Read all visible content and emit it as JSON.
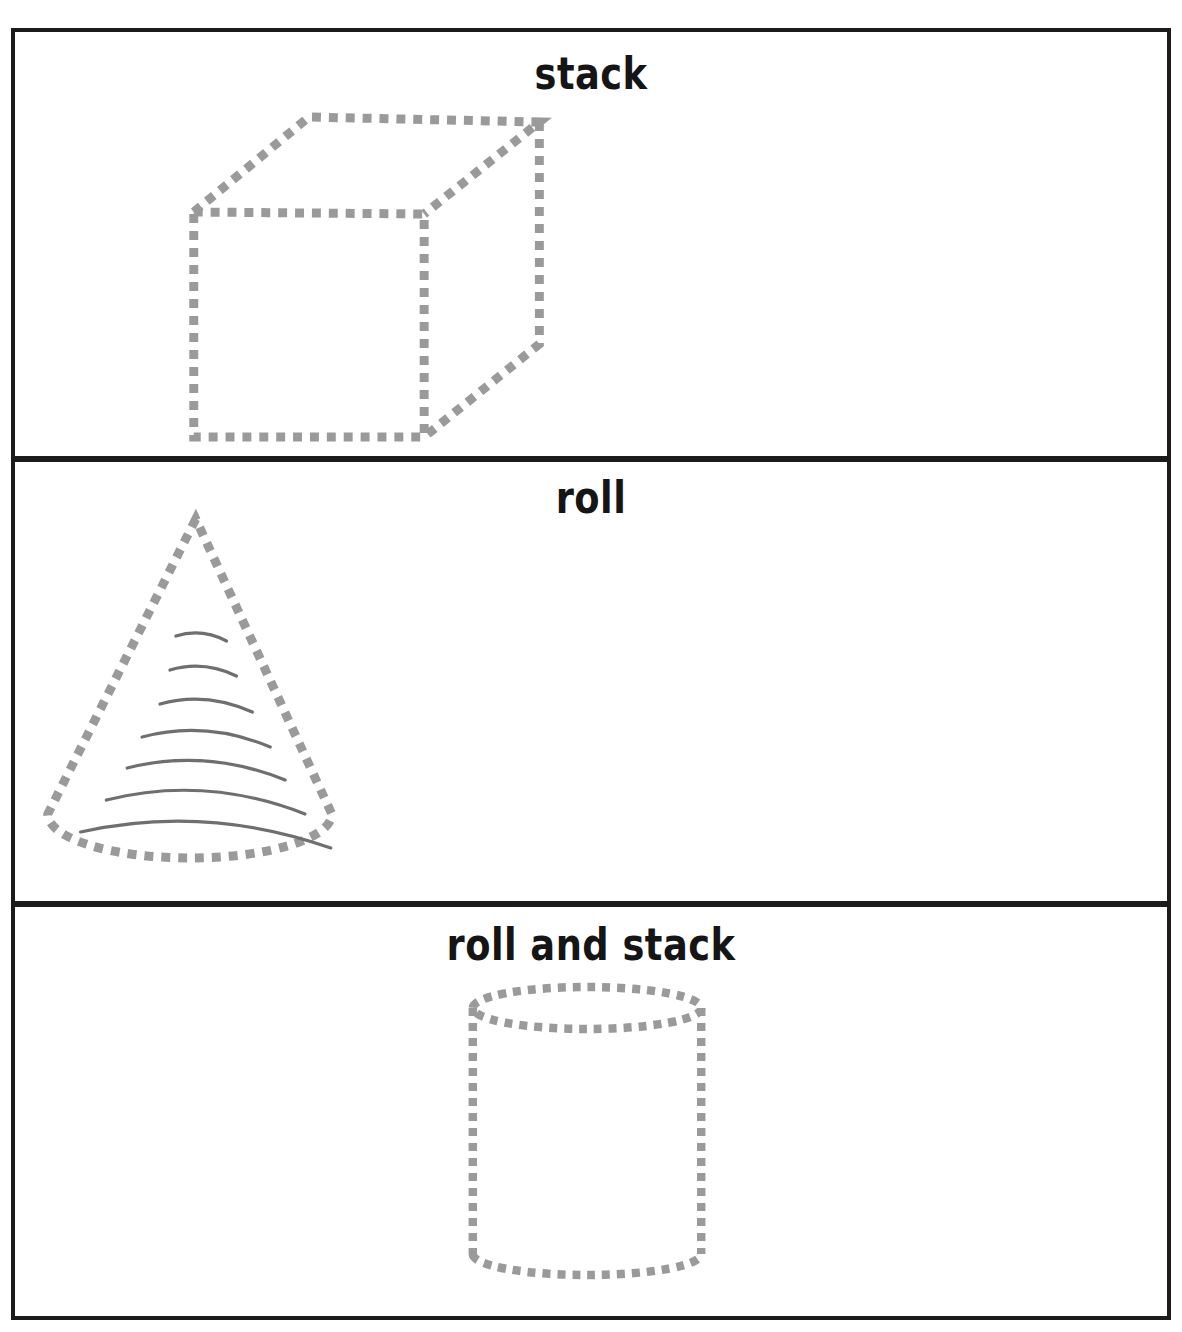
{
  "worksheet": {
    "title_visible": false,
    "page_width": 1182,
    "page_height": 1332,
    "border_color": "#1c1c1c",
    "shape_outline_color": "#9a9a9a",
    "shape_rib_color": "#6f6f6f",
    "background_color": "#ffffff"
  },
  "panels": [
    {
      "id": "stack",
      "label": "stack",
      "shape": "cube",
      "shape_name": "dashed-cube-outline",
      "shape_position": "left",
      "outline_style": "dashed"
    },
    {
      "id": "roll",
      "label": "roll",
      "shape": "cone",
      "shape_name": "dashed-cone-outline",
      "shape_position": "left",
      "outline_style": "dashed",
      "rib_line_count": 7
    },
    {
      "id": "roll_and_stack",
      "label": "roll and stack",
      "shape": "cylinder",
      "shape_name": "dashed-cylinder-outline",
      "shape_position": "center",
      "outline_style": "dashed"
    }
  ]
}
